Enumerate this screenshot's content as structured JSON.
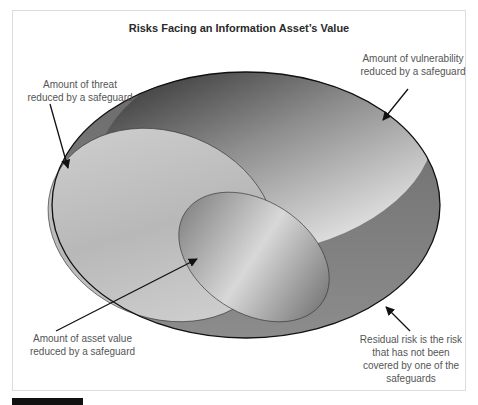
{
  "title": "Risks Facing an Information Asset’s Value",
  "labels": {
    "threat": [
      "Amount of threat",
      "reduced by a safeguard"
    ],
    "vulnerability": [
      "Amount of vulnerability",
      "reduced by a safeguard"
    ],
    "asset_value": [
      "Amount of asset value",
      "reduced by a safeguard"
    ],
    "residual": [
      "Residual risk is the risk",
      "that has not been",
      "covered by one of the",
      "safeguards"
    ]
  },
  "regions": [
    {
      "name": "residual-risk",
      "shape": "ellipse",
      "color": "#8a8a8a"
    },
    {
      "name": "vulnerability-reduced",
      "shape": "ellipse",
      "color_top": "#4a4a4a",
      "color_bottom": "#d8d8d8"
    },
    {
      "name": "threat-reduced",
      "shape": "ellipse",
      "color": "#c4c4c4"
    },
    {
      "name": "asset-value-reduced",
      "shape": "ellipse",
      "color": "#b0b0b0"
    }
  ],
  "colors": {
    "outline": "#111111",
    "text": "#555555",
    "title": "#2a2a2a"
  }
}
